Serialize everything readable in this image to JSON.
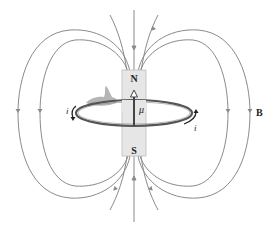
{
  "diagram": {
    "type": "magnetic dipole field of current loop / bar magnet",
    "magnet": {
      "north_label": "N",
      "south_label": "S",
      "fill": "#e6e6e6"
    },
    "moment_label": "μ",
    "current_label_left": "i",
    "current_label_right": "i",
    "field_label": "B",
    "colors": {
      "field_lines": "#8a8a8a",
      "loop": "#555555",
      "arrow": "#333333",
      "hand": "#9a9a9a"
    }
  }
}
